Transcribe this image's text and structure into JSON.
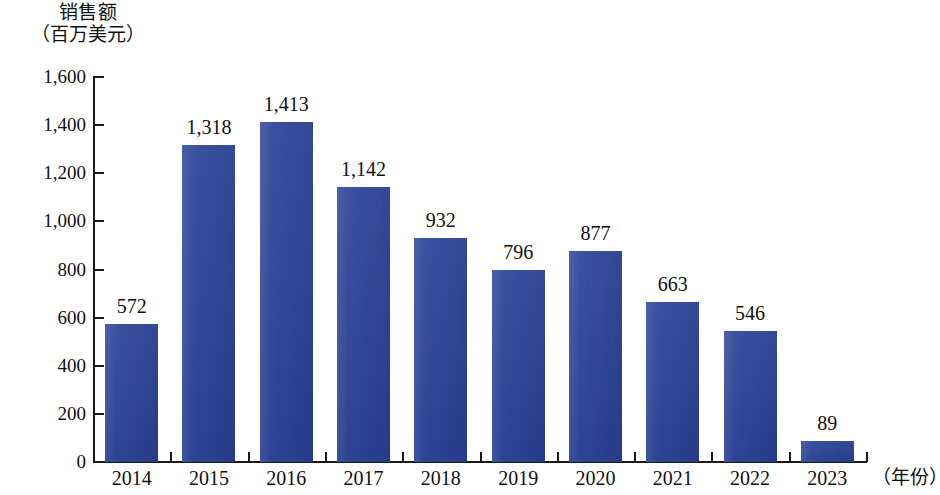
{
  "chart_data": {
    "type": "bar",
    "title": "",
    "ylabel_line1": "销售额",
    "ylabel_line2": "（百万美元）",
    "xlabel": "（年份）",
    "categories": [
      "2014",
      "2015",
      "2016",
      "2017",
      "2018",
      "2019",
      "2020",
      "2021",
      "2022",
      "2023"
    ],
    "values": [
      572,
      1318,
      1413,
      1142,
      932,
      796,
      877,
      663,
      546,
      89
    ],
    "value_labels": [
      "572",
      "1,318",
      "1,413",
      "1,142",
      "932",
      "796",
      "877",
      "663",
      "546",
      "89"
    ],
    "ylim": [
      0,
      1600
    ],
    "ytick_values": [
      0,
      200,
      400,
      600,
      800,
      1000,
      1200,
      1400,
      1600
    ],
    "ytick_labels": [
      "0",
      "200",
      "400",
      "600",
      "800",
      "1,000",
      "1,200",
      "1,400",
      "1,600"
    ],
    "grid": false,
    "legend": false,
    "series_color": "#2b4399",
    "axis_color": "#1a1a1a",
    "text_color": "#111111",
    "background": "#ffffff"
  }
}
